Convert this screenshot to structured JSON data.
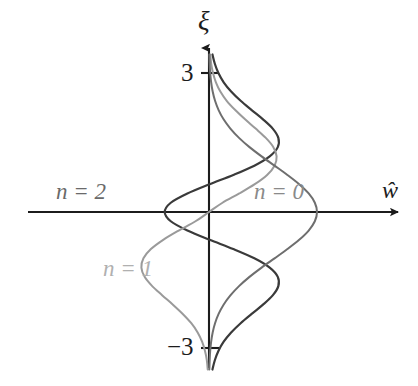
{
  "figure": {
    "background": "#ffffff",
    "title": ""
  },
  "axes": {
    "vertical": {
      "name": "xi-axis",
      "label": "ξ",
      "label_color": "#1c1c1c",
      "arrow": true,
      "x_px": 209,
      "ticks": [
        {
          "value": 3,
          "label": "3",
          "y_px": 73
        },
        {
          "value": -3,
          "label": "−3",
          "y_px": 348
        }
      ]
    },
    "horizontal": {
      "name": "w-axis",
      "label": "ŵ",
      "label_color": "#1c1c1c",
      "arrow": true,
      "y_px": 212
    },
    "axis_color": "#1c1c1c",
    "origin_px": {
      "x": 209,
      "y": 212
    }
  },
  "series_labels": {
    "n0": "n = 0",
    "n1": "n = 1",
    "n2": "n = 2"
  },
  "chart_data": {
    "type": "line",
    "title": "",
    "xlabel": "ŵ",
    "ylabel": "ξ",
    "orientation": "horizontal-value-vs-vertical-coordinate",
    "grid": false,
    "legend": "inline-annotations",
    "xlim": [
      -2.4,
      2.4
    ],
    "ylim": [
      -3.4,
      3.4
    ],
    "yticks": [
      3,
      -3
    ],
    "ytick_labels": [
      "3",
      "−3"
    ],
    "xticks": [],
    "series": [
      {
        "name": "n = 0",
        "label": "n = 0",
        "color": "#6e6e6e",
        "linewidth": 2.0,
        "n": 0,
        "x": [
          -3.4,
          -3.2,
          -3.0,
          -2.8,
          -2.6,
          -2.4,
          -2.2,
          -2.0,
          -1.8,
          -1.6,
          -1.4,
          -1.2,
          -1.0,
          -0.8,
          -0.6,
          -0.4,
          -0.2,
          0.0,
          0.2,
          0.4,
          0.6,
          0.8,
          1.0,
          1.2,
          1.4,
          1.6,
          1.8,
          2.0,
          2.2,
          2.4,
          2.6,
          2.8,
          3.0,
          3.2,
          3.4
        ],
        "y": [
          0.003,
          0.006,
          0.011,
          0.02,
          0.034,
          0.056,
          0.089,
          0.135,
          0.198,
          0.278,
          0.375,
          0.487,
          0.607,
          0.726,
          0.835,
          0.923,
          0.98,
          1.0,
          0.98,
          0.923,
          0.835,
          0.726,
          0.607,
          0.487,
          0.375,
          0.278,
          0.198,
          0.135,
          0.089,
          0.056,
          0.034,
          0.02,
          0.011,
          0.006,
          0.003
        ],
        "formula": "exp(-xi^2/2)"
      },
      {
        "name": "n = 1",
        "label": "n = 1",
        "color": "#9a9a9a",
        "linewidth": 2.0,
        "n": 1,
        "x": [
          -3.4,
          -3.2,
          -3.0,
          -2.8,
          -2.6,
          -2.4,
          -2.2,
          -2.0,
          -1.8,
          -1.6,
          -1.4,
          -1.2,
          -1.0,
          -0.8,
          -0.6,
          -0.4,
          -0.2,
          0.0,
          0.2,
          0.4,
          0.6,
          0.8,
          1.0,
          1.2,
          1.4,
          1.6,
          1.8,
          2.0,
          2.2,
          2.4,
          2.6,
          2.8,
          3.0,
          3.2,
          3.4
        ],
        "y": [
          -0.012,
          -0.02,
          -0.037,
          -0.064,
          -0.105,
          -0.164,
          -0.243,
          -0.334,
          -0.432,
          -0.526,
          -0.596,
          -0.626,
          -0.607,
          -0.538,
          -0.424,
          -0.281,
          -0.125,
          0.0,
          0.125,
          0.281,
          0.424,
          0.538,
          0.607,
          0.626,
          0.596,
          0.526,
          0.432,
          0.334,
          0.243,
          0.164,
          0.105,
          0.064,
          0.037,
          0.02,
          0.012
        ],
        "formula": "xi*exp(-xi^2/2) normalized"
      },
      {
        "name": "n = 2",
        "label": "n = 2",
        "color": "#3a3a3a",
        "linewidth": 2.2,
        "n": 2,
        "x": [
          -3.4,
          -3.2,
          -3.0,
          -2.8,
          -2.6,
          -2.4,
          -2.2,
          -2.0,
          -1.8,
          -1.6,
          -1.4,
          -1.2,
          -1.0,
          -0.8,
          -0.6,
          -0.4,
          -0.2,
          0.0,
          0.2,
          0.4,
          0.6,
          0.8,
          1.0,
          1.2,
          1.4,
          1.6,
          1.8,
          2.0,
          2.2,
          2.4,
          2.6,
          2.8,
          3.0,
          3.2,
          3.4
        ],
        "y": [
          0.032,
          0.054,
          0.087,
          0.136,
          0.205,
          0.293,
          0.395,
          0.5,
          0.59,
          0.642,
          0.637,
          0.562,
          0.42,
          0.225,
          0.006,
          -0.2,
          -0.354,
          -0.41,
          -0.354,
          -0.2,
          0.006,
          0.225,
          0.42,
          0.562,
          0.637,
          0.642,
          0.59,
          0.5,
          0.395,
          0.293,
          0.205,
          0.136,
          0.087,
          0.054,
          0.032
        ],
        "formula": "(2*xi^2-1)*exp(-xi^2/2) normalized"
      }
    ]
  },
  "colors": {
    "axis": "#1c1c1c",
    "n0_curve": "#6e6e6e",
    "n1_curve": "#9a9a9a",
    "n2_curve": "#3a3a3a",
    "n0_label": "#8a8a8a",
    "n1_label": "#b0b0b0",
    "n2_label": "#6a6a6a",
    "text": "#1c1c1c",
    "background": "#ffffff"
  }
}
